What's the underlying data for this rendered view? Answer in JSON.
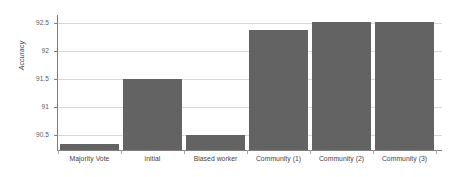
{
  "chart_data": {
    "type": "bar",
    "title": "",
    "subtitle": "",
    "xlabel": "",
    "ylabel": "Accuracy",
    "categories": [
      "Majority Vote",
      "initial",
      "Biased worker",
      "Community (1)",
      "Community (2)",
      "Community (3)"
    ],
    "values": [
      90.33,
      91.51,
      90.5,
      92.39,
      92.53,
      92.53
    ],
    "series": [
      {
        "name": "Accuracy",
        "values": [
          90.33,
          91.51,
          90.5,
          92.39,
          92.53,
          92.53
        ]
      }
    ],
    "ylim": [
      90.23,
      92.65
    ],
    "ytick_labels": [
      "90.5",
      "91",
      "91.5",
      "92",
      "92.5"
    ],
    "ytick_values": [
      90.5,
      91,
      91.5,
      92,
      92.5
    ],
    "grid": true,
    "legend": "none",
    "bar_color": "#636363",
    "gridline_color": "#d9d9d9",
    "axis_color": "#7f7f7f",
    "tick_label_color": "#595959"
  }
}
